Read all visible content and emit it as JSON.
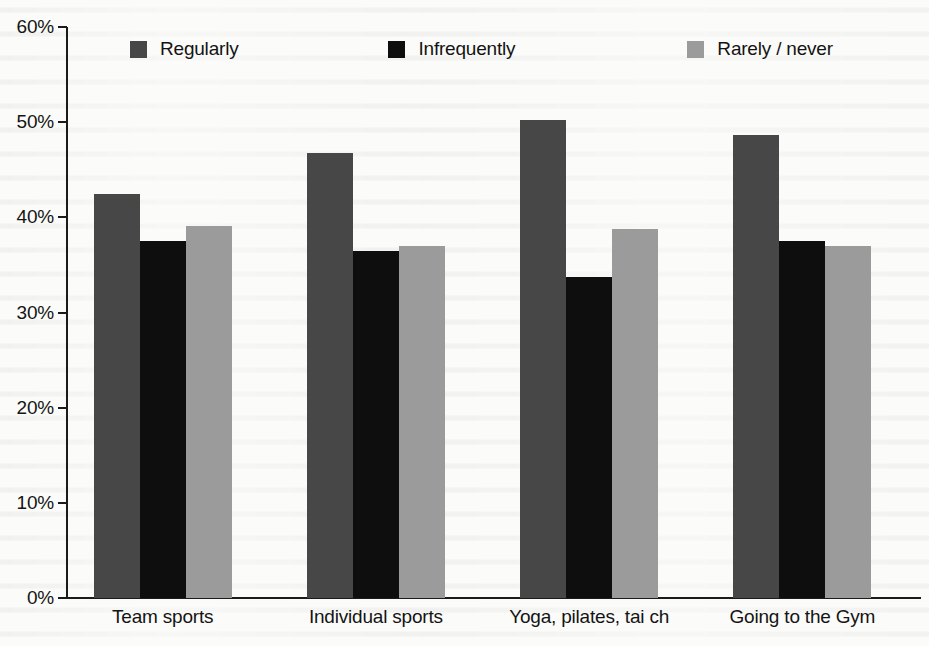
{
  "chart_data": {
    "type": "bar",
    "title": "",
    "subtitle": "",
    "xlabel": "",
    "ylabel": "",
    "ylim": [
      0,
      60
    ],
    "ytick_labels": [
      "0%",
      "10%",
      "20%",
      "30%",
      "40%",
      "50%",
      "60%"
    ],
    "ytick_values": [
      0,
      10,
      20,
      30,
      40,
      50,
      60
    ],
    "grid": false,
    "legend_position": "top",
    "value_suffix": "%",
    "categories": [
      "Team sports",
      "Individual sports",
      "Yoga, pilates, tai ch",
      "Going to the Gym"
    ],
    "series": [
      {
        "name": "Regularly",
        "color": "#474747",
        "values": [
          42.5,
          46.8,
          50.2,
          48.7
        ]
      },
      {
        "name": "Infrequently",
        "color": "#0e0e0e",
        "values": [
          37.5,
          36.5,
          33.7,
          37.5
        ]
      },
      {
        "name": "Rarely / never",
        "color": "#9b9b9b",
        "values": [
          39.1,
          37.0,
          38.8,
          37.0
        ]
      }
    ]
  },
  "legend": {
    "items": [
      {
        "label": "Regularly",
        "color": "#474747"
      },
      {
        "label": "Infrequently",
        "color": "#0e0e0e"
      },
      {
        "label": "Rarely / never",
        "color": "#9b9b9b"
      }
    ]
  }
}
